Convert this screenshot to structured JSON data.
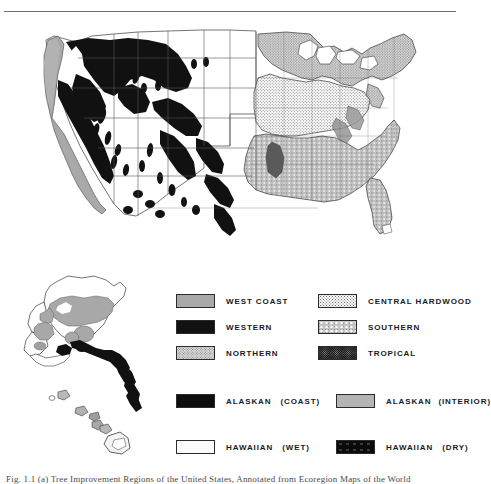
{
  "figure": {
    "caption": "Fig. 1.1 (a) Tree Improvement Regions of the United States, Annotated from Ecoregion Maps of the World",
    "top_rule": true
  },
  "maps": {
    "main": {
      "name": "conterminous-united-states-map",
      "description": "Map of the conterminous United States shaded by tree improvement region"
    },
    "inset": {
      "name": "alaska-hawaii-inset-map",
      "description": "Inset map showing Alaska and the Hawaiian Islands"
    }
  },
  "legend": {
    "rows": [
      {
        "left": {
          "label": "WEST COAST",
          "pattern": "solid-gray",
          "color": "#a9a9a9"
        },
        "right": {
          "label": "CENTRAL HARDWOOD",
          "pattern": "dot-light",
          "color": "#d5d5d5"
        }
      },
      {
        "left": {
          "label": "WESTERN",
          "pattern": "black",
          "color": "#111111"
        },
        "right": {
          "label": "SOUTHERN",
          "pattern": "mottle",
          "color": "#c3c3c3"
        }
      },
      {
        "left": {
          "label": "NORTHERN",
          "pattern": "dot-mid",
          "color": "#d8d8d8"
        },
        "right": {
          "label": "TROPICAL",
          "pattern": "dense-dark",
          "color": "#1b1b1b"
        }
      }
    ],
    "alaska": {
      "left": {
        "label": "ALASKAN",
        "qualifier": "(COAST)",
        "pattern": "very-dark",
        "color": "#0d0d0d"
      },
      "right": {
        "label": "ALASKAN",
        "qualifier": "(INTERIOR)",
        "pattern": "medium-gray",
        "color": "#b4b4b4"
      }
    },
    "hawaii": {
      "left": {
        "label": "HAWAIIAN",
        "qualifier": "(WET)",
        "pattern": "very-light-dot",
        "color": "#fbfbfb"
      },
      "right": {
        "label": "HAWAIIAN",
        "qualifier": "(DRY)",
        "pattern": "black-blob",
        "color": "#0b0b0b"
      }
    }
  }
}
